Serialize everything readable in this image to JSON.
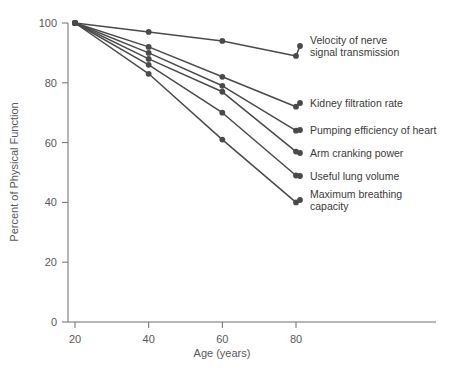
{
  "chart_data": {
    "type": "line",
    "title": "",
    "xlabel": "Age (years)",
    "ylabel": "Percent of Physical Function",
    "xlim": [
      10,
      85
    ],
    "ylim": [
      0,
      100
    ],
    "xticks": [
      20,
      40,
      60,
      80
    ],
    "yticks": [
      0,
      20,
      40,
      60,
      80,
      100
    ],
    "xtick_labels": [
      "20",
      "40",
      "60",
      "80"
    ],
    "ytick_labels": [
      "0",
      "20",
      "40",
      "60",
      "80",
      "100"
    ],
    "grid": false,
    "legend_position": "right-inline-labels",
    "x": [
      20,
      40,
      60,
      80
    ],
    "series": [
      {
        "name": "Velocity of nerve signal transmission",
        "label_lines": [
          "Velocity of nerve",
          "signal transmission"
        ],
        "color": "#4a4a4a",
        "values": [
          100,
          97,
          94,
          89
        ]
      },
      {
        "name": "Kidney filtration rate",
        "label_lines": [
          "Kidney filtration rate"
        ],
        "color": "#4a4a4a",
        "values": [
          100,
          92,
          82,
          72
        ]
      },
      {
        "name": "Pumping efficiency of heart",
        "label_lines": [
          "Pumping efficiency of heart"
        ],
        "color": "#4a4a4a",
        "values": [
          100,
          90,
          79,
          64
        ]
      },
      {
        "name": "Arm cranking power",
        "label_lines": [
          "Arm cranking power"
        ],
        "color": "#4a4a4a",
        "values": [
          100,
          88,
          77,
          57
        ]
      },
      {
        "name": "Useful lung volume",
        "label_lines": [
          "Useful lung volume"
        ],
        "color": "#4a4a4a",
        "values": [
          100,
          86,
          70,
          49
        ]
      },
      {
        "name": "Maximum breathing capacity",
        "label_lines": [
          "Maximum breathing",
          "capacity"
        ],
        "color": "#4a4a4a",
        "values": [
          100,
          83,
          61,
          40
        ]
      }
    ]
  },
  "axes": {
    "x_title": "Age (years)",
    "y_title": "Percent of Physical Function"
  },
  "colors": {
    "line": "#4a4a4a",
    "axis": "#6d6e71",
    "tick_text": "#58595b",
    "label_text": "#3a3a3a",
    "background": "#ffffff"
  }
}
